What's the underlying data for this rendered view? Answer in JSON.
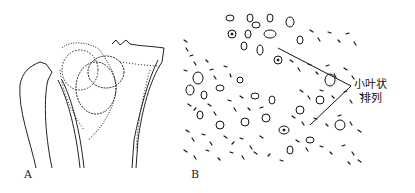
{
  "figure": {
    "panels": [
      {
        "id": "A",
        "label": "A",
        "description": "line drawing of bone with lobulated lesion"
      },
      {
        "id": "B",
        "label": "B",
        "description": "histology sketch of cells in lobulated arrangement"
      }
    ],
    "annotation": {
      "line1": "小叶状",
      "line2": "排列"
    },
    "colors": {
      "ink": "#111111",
      "background": "#ffffff"
    }
  }
}
